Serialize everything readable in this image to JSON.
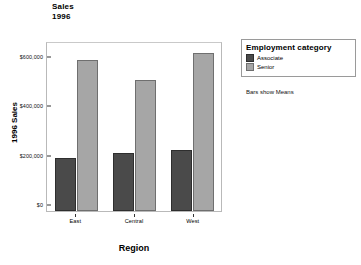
{
  "chart_data": {
    "type": "bar",
    "title": "Sales",
    "subtitle": "1996",
    "xlabel": "Region",
    "ylabel": "1996 Sales",
    "categories": [
      "East",
      "Central",
      "West"
    ],
    "series": [
      {
        "name": "Associate",
        "color": "#4a4a4a",
        "values": [
          216000,
          235000,
          247000
        ]
      },
      {
        "name": "Senior",
        "color": "#a6a6a6",
        "values": [
          612000,
          530000,
          640000
        ]
      }
    ],
    "ylim": [
      0,
      680000
    ],
    "yticks": [
      0,
      200000,
      400000,
      600000
    ],
    "ytick_labels": [
      "$0",
      "$200,000",
      "$400,000",
      "$600,000"
    ],
    "grid": false,
    "legend_position": "right",
    "legend_title": "Employment category",
    "annotation": "Bars show Means"
  }
}
